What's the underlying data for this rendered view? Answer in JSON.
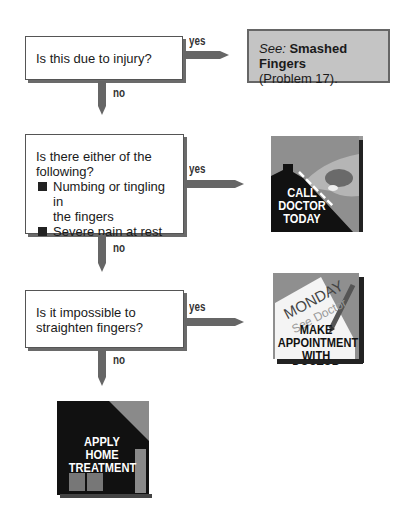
{
  "flowchart": {
    "steps": [
      {
        "question": "Is this due to injury?",
        "yes_label": "yes",
        "no_label": "no",
        "result": {
          "see_prefix": "See:",
          "title": "Smashed Fingers",
          "reference": "(Problem 17)."
        }
      },
      {
        "question_line1": "Is there either of the",
        "question_line2": "following?",
        "bullets": [
          {
            "line1": "Numbing or tingling in",
            "line2": "the fingers"
          },
          {
            "line1": "Severe pain at rest"
          }
        ],
        "yes_label": "yes",
        "no_label": "no",
        "result": {
          "icon": "call-doctor-icon",
          "line1": "CALL",
          "line2": "DOCTOR",
          "line3": "TODAY"
        }
      },
      {
        "question_line1": "Is it impossible to",
        "question_line2": "straighten fingers?",
        "yes_label": "yes",
        "no_label": "no",
        "result": {
          "icon": "appointment-icon",
          "note_day": "MONDAY",
          "note_text": "See Doctor",
          "line1": "MAKE",
          "line2": "APPOINTMENT",
          "line3": "WITH DOCTOR"
        }
      }
    ],
    "final": {
      "icon": "home-treatment-icon",
      "line1": "APPLY",
      "line2": "HOME",
      "line3": "TREATMENT"
    }
  },
  "colors": {
    "arrow": "#666666",
    "result_box": "#c4c4c4",
    "icon_dark": "#111111",
    "icon_gray": "#9a9a9a"
  }
}
